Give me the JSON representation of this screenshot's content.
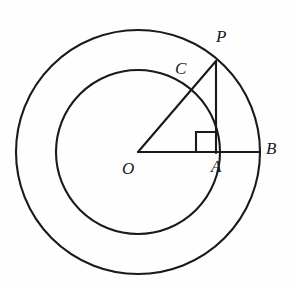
{
  "figure": {
    "type": "geometry-diagram",
    "background_color": "#fefefe",
    "stroke_color": "#1a1a1a",
    "labels": {
      "center": "O",
      "outer_point_upper": "P",
      "inner_intersection": "C",
      "foot_of_perpendicular": "A",
      "outer_point_right": "B"
    },
    "geometry": {
      "center": {
        "x": 138,
        "y": 152
      },
      "outer_radius": 122,
      "inner_radius": 82,
      "points": {
        "O": {
          "x": 138,
          "y": 152
        },
        "P": {
          "x": 216,
          "y": 61
        },
        "C": {
          "x": 190,
          "y": 91
        },
        "A": {
          "x": 216,
          "y": 152
        },
        "B": {
          "x": 260,
          "y": 152
        }
      },
      "segments": [
        {
          "name": "OB",
          "from": "O",
          "to": "B"
        },
        {
          "name": "OP",
          "from": "O",
          "to": "P"
        },
        {
          "name": "PA",
          "from": "P",
          "to": "A"
        }
      ],
      "right_angle_at": "A",
      "right_angle_marker": {
        "x": 196,
        "y": 132,
        "size": 20
      }
    }
  }
}
